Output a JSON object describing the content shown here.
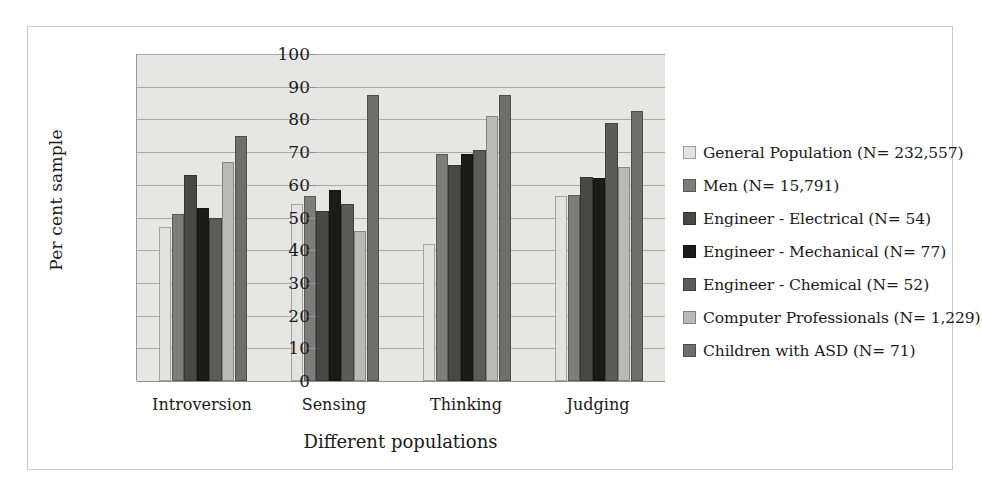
{
  "chart_data": {
    "type": "bar",
    "title": "",
    "xlabel": "Different populations",
    "ylabel": "Per cent sample",
    "categories": [
      "Introversion",
      "Sensing",
      "Thinking",
      "Judging"
    ],
    "ylim": [
      0,
      100
    ],
    "yticks": [
      0,
      10,
      20,
      30,
      40,
      50,
      60,
      70,
      80,
      90,
      100
    ],
    "grid": true,
    "legend_position": "right",
    "series": [
      {
        "name": "General Population (N= 232,557)",
        "color": "#e2e2e0",
        "values": [
          47,
          54,
          42,
          56.5
        ]
      },
      {
        "name": "Men (N= 15,791)",
        "color": "#7d7d7b",
        "values": [
          51,
          56.5,
          69.5,
          57
        ]
      },
      {
        "name": "Engineer - Electrical (N= 54)",
        "color": "#484846",
        "values": [
          63,
          52,
          66,
          62.5
        ]
      },
      {
        "name": "Engineer - Mechanical  (N= 77)",
        "color": "#1b1b19",
        "values": [
          53,
          58.5,
          69.5,
          62
        ]
      },
      {
        "name": "Engineer - Chemical (N= 52)",
        "color": "#5b5b59",
        "values": [
          50,
          54,
          70.5,
          79
        ]
      },
      {
        "name": "Computer Professionals (N= 1,229)",
        "color": "#b9b9b7",
        "values": [
          67,
          46,
          81,
          65.5
        ]
      },
      {
        "name": "Children with ASD (N= 71)",
        "color": "#6e6e6c",
        "values": [
          75,
          87.5,
          87.5,
          82.5
        ]
      }
    ]
  }
}
